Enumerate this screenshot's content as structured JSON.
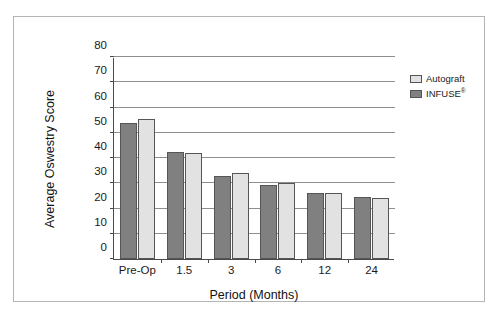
{
  "chart_data": {
    "type": "bar",
    "title": "",
    "xlabel": "Period (Months)",
    "ylabel": "Average Oswestry Score",
    "categories": [
      "Pre-Op",
      "1.5",
      "3",
      "6",
      "12",
      "24"
    ],
    "series": [
      {
        "name": "INFUSE®",
        "color": "#808080",
        "values": [
          54,
          42.5,
          33,
          29.5,
          26,
          24.5
        ]
      },
      {
        "name": "Autograft",
        "color": "#e2e2e2",
        "values": [
          55.5,
          42,
          34,
          30,
          26,
          24
        ]
      }
    ],
    "ylim": [
      0,
      80
    ],
    "yticks": [
      0,
      10,
      20,
      30,
      40,
      50,
      60,
      70,
      80
    ],
    "ytick_labels": [
      "0",
      "10",
      "20",
      "30",
      "40",
      "50",
      "60",
      "70",
      "80"
    ],
    "grid": "horizontal",
    "legend_position": "right"
  },
  "legend": {
    "entries": [
      {
        "label": "Autograft",
        "suffix": "",
        "swatch": "light"
      },
      {
        "label": "INFUSE",
        "suffix": "®",
        "swatch": "dark"
      }
    ]
  }
}
